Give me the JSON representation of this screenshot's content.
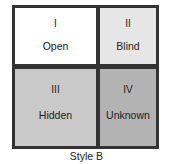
{
  "diagram": {
    "type": "johari-window",
    "quadrants": [
      {
        "numeral": "I",
        "label": "Open",
        "color": "#ffffff"
      },
      {
        "numeral": "II",
        "label": "Blind",
        "color": "#e6e6e6"
      },
      {
        "numeral": "III",
        "label": "Hidden",
        "color": "#c9c9c9"
      },
      {
        "numeral": "IV",
        "label": "Unknown",
        "color": "#b3b3b3"
      }
    ],
    "border_color": "#333333",
    "caption": "Style B"
  }
}
